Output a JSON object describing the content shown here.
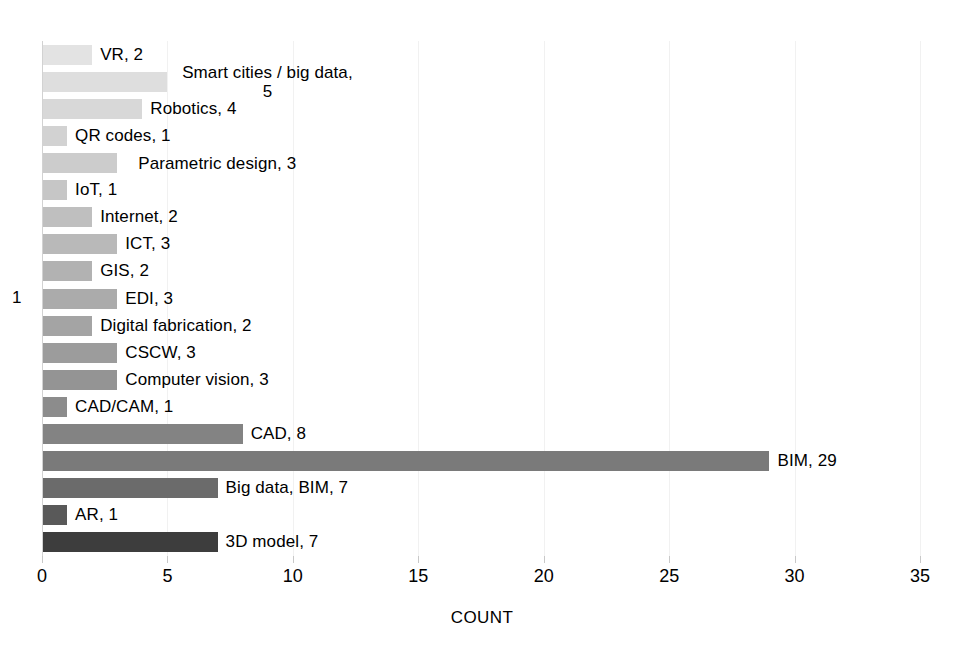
{
  "chart_data": {
    "type": "bar",
    "orientation": "horizontal",
    "title": "",
    "xlabel": "COUNT",
    "ylabel": "1",
    "xlim": [
      0,
      35
    ],
    "xticks": [
      0,
      5,
      10,
      15,
      20,
      25,
      30,
      35
    ],
    "xtick_labels": [
      "0",
      "5",
      "10",
      "15",
      "20",
      "25",
      "30",
      "35"
    ],
    "grid": "vertical-major",
    "legend": "none",
    "categories": [
      "VR",
      "Smart cities / big data",
      "Robotics",
      "QR codes",
      "Parametric design",
      "IoT",
      "Internet",
      "ICT",
      "GIS",
      "EDI",
      "Digital fabrication",
      "CSCW",
      "Computer vision",
      "CAD/CAM",
      "CAD",
      "BIM",
      "Big data, BIM",
      "AR",
      "3D model"
    ],
    "values": [
      2,
      5,
      4,
      1,
      3,
      1,
      2,
      3,
      2,
      3,
      2,
      3,
      3,
      1,
      8,
      29,
      7,
      1,
      7
    ],
    "bars": [
      {
        "label": "VR, 2",
        "category": "VR",
        "value": 2,
        "color": "#e3e3e3",
        "wrap": false
      },
      {
        "label": "Smart cities / big data, 5",
        "category": "Smart cities / big data",
        "value": 5,
        "color": "#dedede",
        "wrap": true
      },
      {
        "label": "Robotics, 4",
        "category": "Robotics",
        "value": 4,
        "color": "#d8d8d8",
        "wrap": false
      },
      {
        "label": "QR codes, 1",
        "category": "QR codes",
        "value": 1,
        "color": "#d2d2d2",
        "wrap": false
      },
      {
        "label": "Parametric design, 3",
        "category": "Parametric design",
        "value": 3,
        "color": "#cccccc",
        "wrap": true
      },
      {
        "label": "IoT, 1",
        "category": "IoT",
        "value": 1,
        "color": "#c6c6c6",
        "wrap": false
      },
      {
        "label": "Internet, 2",
        "category": "Internet",
        "value": 2,
        "color": "#bfbfbf",
        "wrap": false
      },
      {
        "label": "ICT, 3",
        "category": "ICT",
        "value": 3,
        "color": "#b9b9b9",
        "wrap": false
      },
      {
        "label": "GIS, 2",
        "category": "GIS",
        "value": 2,
        "color": "#b2b2b2",
        "wrap": false
      },
      {
        "label": "EDI, 3",
        "category": "EDI",
        "value": 3,
        "color": "#ababab",
        "wrap": false
      },
      {
        "label": "Digital fabrication, 2",
        "category": "Digital fabrication",
        "value": 2,
        "color": "#a4a4a4",
        "wrap": false
      },
      {
        "label": "CSCW, 3",
        "category": "CSCW",
        "value": 3,
        "color": "#9c9c9c",
        "wrap": false
      },
      {
        "label": "Computer vision, 3",
        "category": "Computer vision",
        "value": 3,
        "color": "#949494",
        "wrap": false
      },
      {
        "label": "CAD/CAM, 1",
        "category": "CAD/CAM",
        "value": 1,
        "color": "#8c8c8c",
        "wrap": false
      },
      {
        "label": "CAD, 8",
        "category": "CAD",
        "value": 8,
        "color": "#838383",
        "wrap": false
      },
      {
        "label": "BIM, 29",
        "category": "BIM",
        "value": 29,
        "color": "#7a7a7a",
        "wrap": false
      },
      {
        "label": "Big data, BIM, 7",
        "category": "Big data, BIM",
        "value": 7,
        "color": "#6b6b6b",
        "wrap": false
      },
      {
        "label": "AR, 1",
        "category": "AR",
        "value": 1,
        "color": "#595959",
        "wrap": false
      },
      {
        "label": "3D model, 7",
        "category": "3D model",
        "value": 7,
        "color": "#3d3d3d",
        "wrap": false
      }
    ]
  }
}
